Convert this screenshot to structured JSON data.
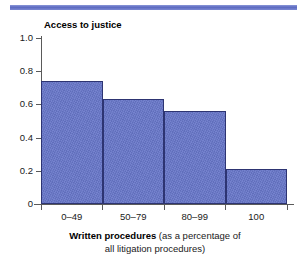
{
  "chart_data": {
    "type": "bar",
    "title": "Access to justice",
    "categories": [
      "0–49",
      "50–79",
      "80–99",
      "100"
    ],
    "values": [
      0.74,
      0.63,
      0.56,
      0.21
    ],
    "xlabel": "Written procedures (as a percentage of all litigation procedures)",
    "xlabel_strong": "Written procedures",
    "xlabel_rest": " (as a percentage of",
    "xlabel_line2": "all litigation procedures)",
    "ylabel": "",
    "ylim": [
      0,
      1.0
    ],
    "yticks": [
      "1.0",
      "0.8",
      "0.6",
      "0.4",
      "0.2",
      "0"
    ],
    "ytick_values": [
      1.0,
      0.8,
      0.6,
      0.4,
      0.2,
      0
    ],
    "grid": false,
    "legend": "none",
    "bar_color": "#6877CA",
    "bar_border_color": "#2D3472",
    "axis_color": "#5A5A5A",
    "rule_color": "#5B69C0"
  }
}
